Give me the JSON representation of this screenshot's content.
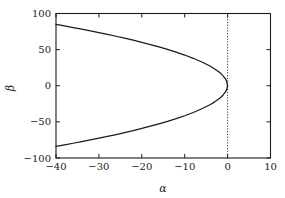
{
  "chart_data": {
    "type": "line",
    "title": "",
    "subtitle": "",
    "xlabel": "α",
    "ylabel": "β",
    "xlim": [
      -40,
      10
    ],
    "ylim": [
      -100,
      100
    ],
    "xticks": [
      -40,
      -30,
      -20,
      -10,
      0,
      10
    ],
    "xtick_labels": [
      "−40",
      "−30",
      "−20",
      "−10",
      "0",
      "10"
    ],
    "yticks": [
      -100,
      -50,
      0,
      50,
      100
    ],
    "ytick_labels": [
      "−100",
      "−50",
      "0",
      "50",
      "100"
    ],
    "grid": false,
    "legend": null,
    "legend_position": "none",
    "background_color": "#ffffff",
    "axis_color": "#1a1a1a",
    "curve_color": "#1a1a1a",
    "reference_line_color": "#1a1a1a",
    "series": [
      {
        "name": "upper branch",
        "style": "solid",
        "x": [
          -40,
          -38,
          -36,
          -34,
          -32,
          -30,
          -28,
          -26,
          -24,
          -22,
          -20,
          -18,
          -16,
          -14,
          -12,
          -10,
          -8,
          -6,
          -4,
          -3,
          -2,
          -1.5,
          -1,
          -0.5,
          -0.25,
          0
        ],
        "values": [
          85.0,
          82.8,
          80.6,
          78.3,
          76.0,
          73.6,
          71.1,
          68.5,
          65.8,
          63.0,
          60.1,
          57.0,
          53.7,
          50.3,
          46.6,
          42.5,
          38.0,
          32.9,
          26.9,
          23.3,
          19.0,
          16.5,
          13.4,
          9.5,
          6.7,
          0.0
        ]
      },
      {
        "name": "lower branch",
        "style": "solid",
        "x": [
          -40,
          -38,
          -36,
          -34,
          -32,
          -30,
          -28,
          -26,
          -24,
          -22,
          -20,
          -18,
          -16,
          -14,
          -12,
          -10,
          -8,
          -6,
          -4,
          -3,
          -2,
          -1.5,
          -1,
          -0.5,
          -0.25,
          0
        ],
        "values": [
          -84.0,
          -81.8,
          -79.6,
          -77.3,
          -75.0,
          -72.6,
          -70.1,
          -67.5,
          -64.8,
          -62.0,
          -59.1,
          -56.0,
          -52.7,
          -49.3,
          -45.6,
          -41.5,
          -37.0,
          -31.9,
          -25.9,
          -22.3,
          -18.0,
          -15.5,
          -12.4,
          -8.5,
          -5.7,
          0.0
        ]
      }
    ],
    "reference_lines": [
      {
        "name": "alpha-zero-line",
        "orientation": "vertical",
        "x": 0,
        "style": "dotted"
      }
    ],
    "annotations": []
  },
  "figure": {
    "name": "alpha-beta-bifurcation-plot"
  }
}
